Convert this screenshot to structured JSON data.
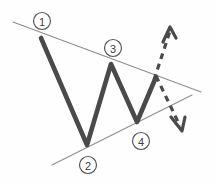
{
  "diagram": {
    "background_color": "#fefefe",
    "wave_color": "#4a4a4a",
    "trendline_color": "#8d8d8d",
    "projection_color": "#4a4a4a",
    "label_stroke_color": "#555555",
    "label_text_color": "#3d3d3d"
  },
  "chart_data": {
    "type": "line",
    "xlabel": "",
    "ylabel": "",
    "xlim": [
      0,
      216
    ],
    "ylim": [
      184,
      0
    ],
    "grid": false,
    "legend": "none",
    "series": [
      {
        "name": "price-wave",
        "style": "solid",
        "color": "#4a4a4a",
        "width": 4.6,
        "points": [
          {
            "x": 41,
            "y": 38,
            "label": "1"
          },
          {
            "x": 87,
            "y": 145,
            "label": "2"
          },
          {
            "x": 111,
            "y": 64,
            "label": "3"
          },
          {
            "x": 137,
            "y": 122,
            "label": "4"
          },
          {
            "x": 156,
            "y": 77,
            "label": ""
          }
        ]
      },
      {
        "name": "upper-trendline",
        "style": "solid",
        "color": "#8d8d8d",
        "width": 1.1,
        "points": [
          {
            "x": 13,
            "y": 22
          },
          {
            "x": 201,
            "y": 92
          }
        ]
      },
      {
        "name": "lower-trendline",
        "style": "solid",
        "color": "#8d8d8d",
        "width": 1.1,
        "points": [
          {
            "x": 52,
            "y": 165
          },
          {
            "x": 192,
            "y": 95
          }
        ]
      },
      {
        "name": "breakout-up-projection",
        "style": "dashed",
        "color": "#4a4a4a",
        "width": 3.2,
        "points": [
          {
            "x": 154,
            "y": 80
          },
          {
            "x": 170,
            "y": 31
          }
        ]
      },
      {
        "name": "breakout-down-projection",
        "style": "dashed",
        "color": "#4a4a4a",
        "width": 3.2,
        "points": [
          {
            "x": 156,
            "y": 76
          },
          {
            "x": 180,
            "y": 126
          }
        ]
      }
    ],
    "annotations": [
      {
        "id": "1",
        "text": "1",
        "x": 42,
        "y": 21,
        "shape": "circle",
        "radius": 8.5
      },
      {
        "id": "2",
        "text": "2",
        "x": 88,
        "y": 165,
        "shape": "circle",
        "radius": 8.5
      },
      {
        "id": "3",
        "text": "3",
        "x": 113,
        "y": 48,
        "shape": "circle",
        "radius": 8.5
      },
      {
        "id": "4",
        "text": "4",
        "x": 141,
        "y": 141,
        "shape": "circle",
        "radius": 8.5
      }
    ],
    "arrows": [
      {
        "id": "up-arrow",
        "direction": "up",
        "tip_x": 170,
        "tip_y": 28
      },
      {
        "id": "down-arrow",
        "direction": "down",
        "tip_x": 182,
        "tip_y": 130
      }
    ]
  },
  "labels": {
    "wave_1": "1",
    "wave_2": "2",
    "wave_3": "3",
    "wave_4": "4"
  }
}
